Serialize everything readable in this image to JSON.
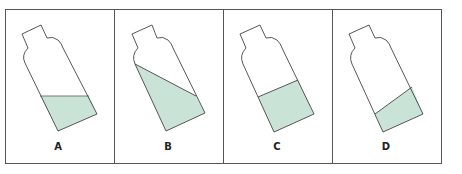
{
  "figure": {
    "colors": {
      "frame": "#555555",
      "outline": "#444444",
      "liquid": "#c9e4d6",
      "background": "#ffffff"
    },
    "panels": [
      {
        "id": "A",
        "label": "A",
        "description": "tilted bottle, liquid surface horizontal"
      },
      {
        "id": "B",
        "label": "B",
        "description": "tilted bottle, liquid surface sloped down toward right wall"
      },
      {
        "id": "C",
        "label": "C",
        "description": "tilted bottle, liquid surface perpendicular to bottle axis"
      },
      {
        "id": "D",
        "label": "D",
        "description": "tilted bottle, liquid surface sloped up toward right wall"
      }
    ]
  }
}
